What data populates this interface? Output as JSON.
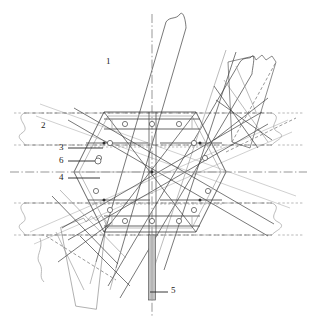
{
  "drawing": {
    "type": "patent-technical-drawing",
    "subject": "structural joint node with hexagonal gusset plate, horizontal beams, diagonal braces and bolted connections",
    "background_color": "#ffffff",
    "line_color": "#3a3a3a",
    "light_line_color": "#9a9a9a",
    "rod_fill_color": "#bdbdbd",
    "callouts": [
      {
        "id": "c1",
        "label": "1",
        "x": 108,
        "y": 62,
        "leader": false
      },
      {
        "id": "c2",
        "label": "2",
        "x": 42,
        "y": 126,
        "leader": false
      },
      {
        "id": "c3",
        "label": "3",
        "x": 60,
        "y": 150,
        "leader": true,
        "line_x1": 68,
        "line_y1": 148,
        "line_x2": 103,
        "line_y2": 148
      },
      {
        "id": "c6",
        "label": "6",
        "x": 60,
        "y": 161,
        "leader": true,
        "line_x1": 68,
        "line_y1": 161,
        "line_x2": 98,
        "line_y2": 161
      },
      {
        "id": "c4",
        "label": "4",
        "x": 60,
        "y": 180,
        "leader": true,
        "line_x1": 68,
        "line_y1": 178,
        "line_x2": 100,
        "line_y2": 178
      },
      {
        "id": "c5",
        "label": "5",
        "x": 170,
        "y": 290,
        "leader": true,
        "line_x1": 168,
        "line_y1": 292,
        "line_x2": 150,
        "line_y2": 292
      }
    ],
    "legend": {
      "1": "diagonal brace member",
      "2": "horizontal beam / chord",
      "3": "splice plate",
      "4": "lower connection plate",
      "5": "central vertical rod / pin",
      "6": "bolt"
    },
    "geometry": {
      "center": {
        "x": 152,
        "y": 172
      },
      "hexagon_plate": [
        [
          104,
          112
        ],
        [
          196,
          112
        ],
        [
          226,
          172
        ],
        [
          196,
          232
        ],
        [
          104,
          232
        ],
        [
          74,
          172
        ]
      ],
      "beams_horizontal": [
        {
          "name": "upper-beam",
          "y_top": 113,
          "y_bottom": 145,
          "x_left": 14,
          "x_right": 303
        },
        {
          "name": "lower-beam",
          "y_top": 203,
          "y_bottom": 235,
          "x_left": 14,
          "x_right": 303
        }
      ],
      "center_line_horizontal_y": 172,
      "center_line_vertical_x": 152,
      "vertical_rod": {
        "x": 148,
        "width": 7,
        "y_top": 235,
        "y_bottom": 300
      },
      "bolt_radius": 2.6,
      "bolt_positions": [
        [
          125,
          124
        ],
        [
          152,
          124
        ],
        [
          179,
          124
        ],
        [
          110,
          143
        ],
        [
          194,
          143
        ],
        [
          99,
          158
        ],
        [
          205,
          158
        ],
        [
          96,
          181
        ],
        [
          208,
          181
        ],
        [
          110,
          200
        ],
        [
          194,
          200
        ],
        [
          125,
          221
        ],
        [
          152,
          221
        ],
        [
          179,
          221
        ]
      ]
    }
  }
}
